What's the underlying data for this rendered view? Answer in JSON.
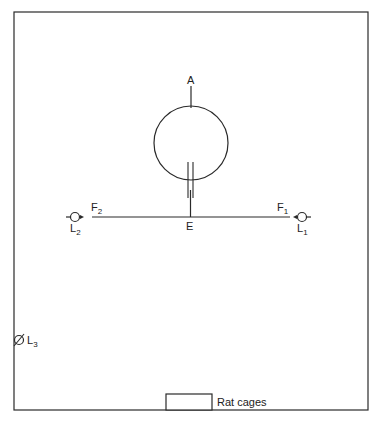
{
  "diagram": {
    "type": "experimental-apparatus-layout",
    "colors": {
      "line": "#2a2a2a",
      "text": "#222222",
      "background": "#ffffff"
    },
    "labels": {
      "A": {
        "main": "A"
      },
      "E": {
        "main": "E"
      },
      "F1": {
        "main": "F",
        "sub": "1"
      },
      "F2": {
        "main": "F",
        "sub": "2"
      },
      "L1": {
        "main": "L",
        "sub": "1"
      },
      "L2": {
        "main": "L",
        "sub": "2"
      },
      "L3": {
        "main": "L",
        "sub": "3"
      }
    },
    "rat_cages": {
      "label": "Rat cages"
    }
  }
}
